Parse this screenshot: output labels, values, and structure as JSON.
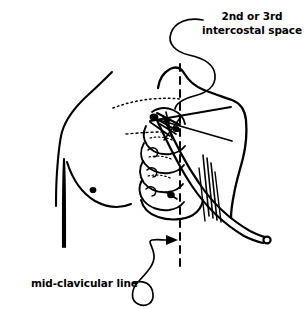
{
  "figure": {
    "type": "medical line drawing",
    "ink_color": "#000000",
    "background_color": "#ffffff",
    "annotations": {
      "upper_right": {
        "line1": "2nd or 3rd",
        "line2": "intercostal space",
        "points_to": "intercostal insertion site"
      },
      "lower_left": {
        "text": "mid-clavicular line",
        "points_to": "vertical dashed reference line"
      }
    },
    "anatomy": [
      {
        "name": "neck-and-shoulder-outline"
      },
      {
        "name": "left-arm-outline"
      },
      {
        "name": "breast-contour"
      },
      {
        "name": "nipple"
      },
      {
        "name": "clavicle-dotted-line"
      },
      {
        "name": "rib-cage"
      },
      {
        "name": "lateral-torso-outline"
      },
      {
        "name": "intercostal-muscle-hatching"
      }
    ],
    "devices": [
      {
        "name": "catheter-tube"
      },
      {
        "name": "catheter-tip-connector"
      },
      {
        "name": "insertion-needle"
      }
    ],
    "guides": [
      {
        "name": "mid-clavicular-dashed-line",
        "orientation": "vertical"
      },
      {
        "name": "leader-arrow",
        "direction": "right"
      }
    ]
  }
}
